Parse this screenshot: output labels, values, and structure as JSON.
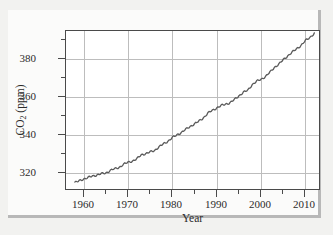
{
  "figure": {
    "background_color": "#f2f2f0",
    "card_color": "#fbfbfa",
    "plot_background": "#ffffff",
    "frame_color": "#4a4a4a",
    "grid_color": "#bdbdbd",
    "line_color": "#5a5a5a"
  },
  "chart_data": {
    "type": "line",
    "title": "",
    "subtitle": "",
    "xlabel": "Year",
    "ylabel": "CO2 (ppm)",
    "ylabel_parts": {
      "prefix": "CO",
      "subscript": "2",
      "suffix": " (ppm)"
    },
    "xlim": [
      1956,
      2013.5
    ],
    "ylim": [
      310.5,
      395
    ],
    "xticks": [
      1960,
      1970,
      1980,
      1990,
      2000,
      2010
    ],
    "xtick_labels": [
      "1960",
      "1970",
      "1980",
      "1990",
      "2000",
      "2010"
    ],
    "xticks_minor": [
      1965,
      1975,
      1985,
      1995,
      2005
    ],
    "yticks": [
      320,
      340,
      360,
      380
    ],
    "ytick_labels": [
      "320",
      "340",
      "360",
      "380"
    ],
    "yticks_minor": [
      330,
      350,
      370,
      390
    ],
    "grid": true,
    "grid_axis": "both",
    "legend": null,
    "legend_position": "none",
    "annotations": [],
    "series": [
      {
        "name": "Atmospheric CO2 concentration (Mauna Loa)",
        "x": [
          1958,
          1959,
          1960,
          1961,
          1962,
          1963,
          1964,
          1965,
          1966,
          1967,
          1968,
          1969,
          1970,
          1971,
          1972,
          1973,
          1974,
          1975,
          1976,
          1977,
          1978,
          1979,
          1980,
          1981,
          1982,
          1983,
          1984,
          1985,
          1986,
          1987,
          1988,
          1989,
          1990,
          1991,
          1992,
          1993,
          1994,
          1995,
          1996,
          1997,
          1998,
          1999,
          2000,
          2001,
          2002,
          2003,
          2004,
          2005,
          2006,
          2007,
          2008,
          2009,
          2010,
          2011,
          2012
        ],
        "values": [
          315.0,
          315.8,
          316.9,
          317.6,
          318.4,
          319.0,
          319.6,
          320.0,
          321.4,
          322.2,
          323.0,
          324.6,
          325.7,
          326.3,
          327.5,
          329.7,
          330.2,
          331.1,
          332.0,
          333.8,
          335.4,
          336.8,
          338.7,
          340.1,
          341.4,
          343.0,
          344.6,
          346.0,
          347.4,
          349.2,
          351.6,
          353.1,
          354.4,
          355.6,
          356.4,
          357.1,
          358.8,
          360.8,
          362.6,
          363.7,
          366.7,
          368.4,
          369.5,
          371.0,
          373.2,
          375.8,
          377.5,
          379.8,
          381.9,
          383.8,
          385.6,
          387.4,
          389.9,
          391.6,
          393.8
        ]
      }
    ]
  },
  "axis": {
    "x_title": "Year",
    "y_title_prefix": "CO",
    "y_title_sub": "2",
    "y_title_suffix": " (ppm)"
  }
}
